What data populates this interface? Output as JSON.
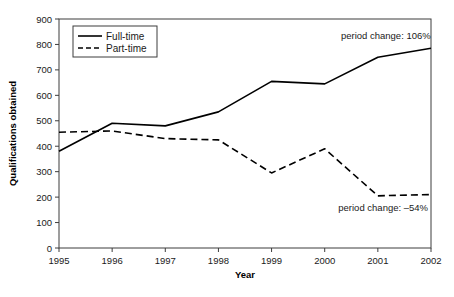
{
  "chart_data": {
    "type": "line",
    "title": "",
    "xlabel": "Year",
    "ylabel": "Qualifications obtained",
    "categories": [
      "1995",
      "1996",
      "1997",
      "1998",
      "1999",
      "2000",
      "2001",
      "2002"
    ],
    "xlim": [
      1995,
      2002
    ],
    "ylim": [
      0,
      900
    ],
    "ytick_step": 100,
    "yticks": [
      "0",
      "100",
      "200",
      "300",
      "400",
      "500",
      "600",
      "700",
      "800",
      "900"
    ],
    "grid": false,
    "legend_position": "top-left-inside",
    "series": [
      {
        "name": "Full-time",
        "style": "solid",
        "color": "#000000",
        "values": [
          380,
          490,
          480,
          535,
          655,
          645,
          750,
          785
        ]
      },
      {
        "name": "Part-time",
        "style": "dashed",
        "color": "#000000",
        "values": [
          455,
          460,
          430,
          425,
          295,
          390,
          205,
          210
        ]
      }
    ],
    "annotations": [
      {
        "text": "period change: 106%",
        "for_series": "Full-time",
        "x": 2001.15,
        "y": 820
      },
      {
        "text": "period change: –54%",
        "for_series": "Part-time",
        "x": 2001.1,
        "y": 145
      }
    ]
  },
  "legend": {
    "items": [
      {
        "label": "Full-time",
        "style": "solid"
      },
      {
        "label": "Part-time",
        "style": "dashed"
      }
    ]
  }
}
